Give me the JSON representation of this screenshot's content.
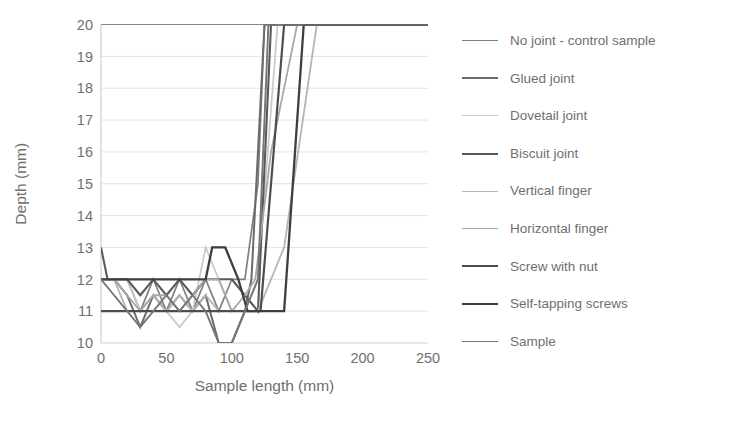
{
  "chart_data": {
    "type": "line",
    "title": "",
    "xlabel": "Sample length (mm)",
    "ylabel": "Depth (mm)",
    "xlim": [
      0,
      250
    ],
    "ylim": [
      10,
      20
    ],
    "xticks": [
      0,
      50,
      100,
      150,
      200,
      250
    ],
    "yticks": [
      10,
      11,
      12,
      13,
      14,
      15,
      16,
      17,
      18,
      19,
      20
    ],
    "grid": "horizontal",
    "legend_position": "right",
    "series": [
      {
        "name": "No joint - control sample",
        "color": "#808080",
        "width": 1.7,
        "x": [
          0,
          10,
          20,
          30,
          40,
          50,
          60,
          70,
          80,
          90,
          100,
          110,
          120,
          125,
          250
        ],
        "y": [
          12,
          12,
          12,
          11,
          12,
          11,
          12,
          11,
          12,
          11,
          12,
          12,
          15,
          20,
          20
        ]
      },
      {
        "name": "Glued joint",
        "color": "#6b6b6b",
        "width": 2.0,
        "x": [
          0,
          10,
          20,
          30,
          40,
          50,
          60,
          70,
          80,
          90,
          100,
          110,
          115,
          125,
          250
        ],
        "y": [
          12,
          12,
          11.5,
          10.5,
          11.5,
          11,
          11.5,
          11,
          11.5,
          10,
          10,
          11,
          12,
          20,
          20
        ]
      },
      {
        "name": "Dovetail joint",
        "color": "#c9c9c9",
        "width": 1.7,
        "x": [
          0,
          10,
          20,
          30,
          40,
          50,
          60,
          70,
          80,
          90,
          100,
          110,
          120,
          135,
          250
        ],
        "y": [
          12,
          12,
          12,
          11,
          11,
          11,
          10.5,
          11,
          13,
          12,
          11,
          11,
          12,
          20,
          20
        ]
      },
      {
        "name": "Biscuit joint",
        "color": "#5a5a5a",
        "width": 2.1,
        "x": [
          0,
          5,
          10,
          20,
          30,
          40,
          50,
          60,
          70,
          80,
          90,
          100,
          110,
          120,
          130,
          250
        ],
        "y": [
          13,
          12,
          12,
          12,
          11.5,
          12,
          11.5,
          12,
          11.5,
          12,
          12,
          12,
          11.5,
          11,
          20,
          20
        ]
      },
      {
        "name": "Vertical finger",
        "color": "#b5b5b5",
        "width": 1.8,
        "x": [
          0,
          10,
          20,
          30,
          40,
          50,
          60,
          70,
          80,
          90,
          100,
          110,
          120,
          140,
          165,
          250
        ],
        "y": [
          12,
          12,
          11,
          11,
          11.5,
          11,
          11.5,
          11,
          11.5,
          11,
          11,
          11,
          11,
          13,
          20,
          20
        ]
      },
      {
        "name": "Horizontal finger",
        "color": "#a8a8a8",
        "width": 1.8,
        "x": [
          0,
          10,
          20,
          30,
          40,
          50,
          60,
          70,
          80,
          90,
          100,
          110,
          118,
          130,
          150,
          250
        ],
        "y": [
          12,
          12,
          11.5,
          11,
          11.5,
          11.5,
          11,
          11.5,
          12,
          12,
          11,
          11.5,
          12,
          16,
          20,
          20
        ]
      },
      {
        "name": "Screw with nut",
        "color": "#4d4d4d",
        "width": 2.2,
        "x": [
          0,
          10,
          20,
          30,
          40,
          50,
          60,
          70,
          80,
          90,
          100,
          110,
          122,
          140,
          250
        ],
        "y": [
          11,
          11,
          11,
          11,
          11,
          11,
          11,
          11,
          11,
          11,
          11,
          11,
          11,
          20,
          20
        ]
      },
      {
        "name": "Self-tapping screws",
        "color": "#3f3f3f",
        "width": 2.3,
        "x": [
          0,
          10,
          20,
          30,
          40,
          50,
          60,
          70,
          80,
          85,
          95,
          105,
          112,
          140,
          155,
          250
        ],
        "y": [
          12,
          12,
          12,
          12,
          12,
          12,
          12,
          12,
          12,
          13,
          13,
          12,
          11,
          11,
          20,
          20
        ]
      },
      {
        "name": "Sample",
        "color": "#757575",
        "width": 1.9,
        "x": [
          0,
          10,
          20,
          30,
          40,
          50,
          60,
          70,
          80,
          90,
          100,
          110,
          120,
          128,
          250
        ],
        "y": [
          12,
          11.5,
          11,
          10.5,
          11,
          11.5,
          11,
          11.5,
          11,
          10,
          10,
          11,
          12,
          20,
          20
        ]
      }
    ]
  }
}
